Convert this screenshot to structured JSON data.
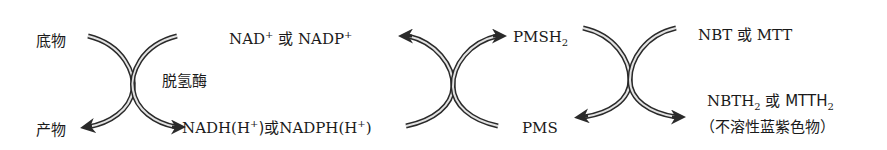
{
  "diagram": {
    "stage1": {
      "substrate": "底物",
      "product": "产物",
      "enzyme": "脱氢酶"
    },
    "stage2": {
      "oxidized_cofactor": {
        "part1": "NAD",
        "sup1": "+",
        "mid": " 或 ",
        "part2": "NADP",
        "sup2": "+"
      },
      "reduced_cofactor": {
        "part1": "NADH(H",
        "sup1": "+",
        "mid": ")或",
        "part2": "NADPH(H",
        "sup2": "+",
        "end": ")"
      }
    },
    "stage3": {
      "reduced_carrier": {
        "base": "PMSH",
        "sub": "2"
      },
      "oxidized_carrier": "PMS"
    },
    "stage4": {
      "dye_oxidized": "NBT 或 MTT",
      "dye_reduced": {
        "a": "NBTH",
        "sub1": "2",
        "mid": " 或 MTTH",
        "sub2": "2"
      },
      "dye_note": "（不溶性蓝紫色物）"
    },
    "colors": {
      "arrow_stroke": "#2a2a2a",
      "arrow_fill": "#d8d8d8",
      "text": "#1a1a1a"
    }
  }
}
